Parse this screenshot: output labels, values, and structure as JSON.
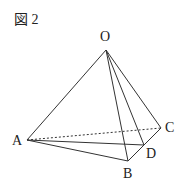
{
  "figure": {
    "title": "図 2",
    "labels": {
      "O": "O",
      "A": "A",
      "B": "B",
      "C": "C",
      "D": "D"
    },
    "points": {
      "O": [
        106,
        50
      ],
      "A": [
        27,
        140
      ],
      "B": [
        128,
        161
      ],
      "C": [
        161,
        128
      ],
      "D": [
        144,
        145
      ]
    },
    "edges_solid": [
      [
        "O",
        "A"
      ],
      [
        "O",
        "B"
      ],
      [
        "O",
        "C"
      ],
      [
        "O",
        "D"
      ],
      [
        "A",
        "B"
      ],
      [
        "A",
        "D"
      ],
      [
        "B",
        "C"
      ]
    ],
    "edges_dashed": [
      [
        "A",
        "C"
      ]
    ],
    "line_color": "#333333"
  }
}
